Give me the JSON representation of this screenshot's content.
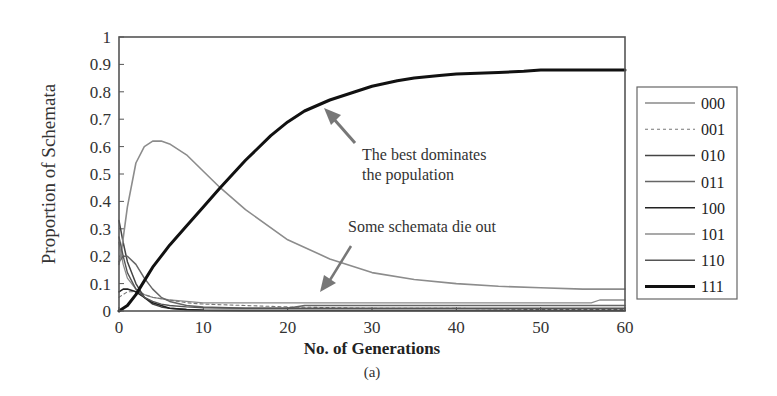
{
  "chart_data": {
    "type": "line",
    "title": "",
    "caption": "(a)",
    "xlabel": "No. of Generations",
    "ylabel": "Proportion of Schemata",
    "xlim": [
      0,
      60
    ],
    "ylim": [
      0,
      1
    ],
    "xticks": [
      0,
      10,
      20,
      30,
      40,
      50,
      60
    ],
    "xtick_labels": [
      "0",
      "10",
      "20",
      "30",
      "40",
      "50",
      "60"
    ],
    "yticks": [
      0,
      0.1,
      0.2,
      0.3,
      0.4,
      0.5,
      0.6,
      0.7,
      0.8,
      0.9,
      1
    ],
    "ytick_labels": [
      "0",
      "0.1",
      "0.2",
      "0.3",
      "0.4",
      "0.5",
      "0.6",
      "0.7",
      "0.8",
      "0.9",
      "1"
    ],
    "grid": false,
    "legend_position": "right",
    "series": [
      {
        "name": "000",
        "color": "#8a8a8a",
        "width": 1.3,
        "dash": "",
        "x": [
          0,
          0.5,
          1,
          2,
          3,
          4,
          6,
          8,
          10,
          15,
          20,
          30,
          40,
          50,
          56,
          57,
          60
        ],
        "y": [
          0.25,
          0.17,
          0.12,
          0.08,
          0.06,
          0.05,
          0.04,
          0.035,
          0.03,
          0.03,
          0.03,
          0.03,
          0.03,
          0.03,
          0.03,
          0.04,
          0.04
        ]
      },
      {
        "name": "001",
        "color": "#777777",
        "width": 1.1,
        "dash": "3,3",
        "x": [
          0,
          1,
          2,
          3,
          4,
          5,
          6,
          8,
          10,
          15,
          20,
          30,
          40,
          50,
          60
        ],
        "y": [
          0.05,
          0.07,
          0.07,
          0.06,
          0.05,
          0.045,
          0.04,
          0.03,
          0.025,
          0.02,
          0.015,
          0.01,
          0.01,
          0.005,
          0.005
        ]
      },
      {
        "name": "010",
        "color": "#444444",
        "width": 1.5,
        "dash": "",
        "x": [
          0,
          0.5,
          1,
          2,
          3,
          4,
          5,
          6,
          8,
          10,
          15,
          20,
          30,
          40,
          50,
          60
        ],
        "y": [
          0.33,
          0.25,
          0.18,
          0.1,
          0.05,
          0.025,
          0.015,
          0.01,
          0.005,
          0.003,
          0.002,
          0.002,
          0.002,
          0.002,
          0.002,
          0.002
        ]
      },
      {
        "name": "011",
        "color": "#666666",
        "width": 1.5,
        "dash": "",
        "x": [
          0,
          0.5,
          1,
          2,
          3,
          4,
          5,
          6,
          8,
          10,
          15,
          20,
          22,
          30,
          40,
          50,
          60
        ],
        "y": [
          0.18,
          0.2,
          0.2,
          0.17,
          0.12,
          0.08,
          0.05,
          0.035,
          0.02,
          0.015,
          0.01,
          0.01,
          0.02,
          0.02,
          0.02,
          0.02,
          0.02
        ]
      },
      {
        "name": "100",
        "color": "#222222",
        "width": 1.6,
        "dash": "",
        "x": [
          0,
          0.5,
          1,
          2,
          3,
          4,
          5,
          6,
          8,
          10,
          15,
          20,
          30,
          40,
          50,
          60
        ],
        "y": [
          0.07,
          0.08,
          0.08,
          0.07,
          0.05,
          0.03,
          0.02,
          0.01,
          0.005,
          0.003,
          0.002,
          0.002,
          0.002,
          0.002,
          0.002,
          0.002
        ]
      },
      {
        "name": "101",
        "color": "#8c8c8c",
        "width": 1.6,
        "dash": "",
        "x": [
          0,
          0.3,
          1,
          2,
          3,
          4,
          5,
          6,
          8,
          10,
          12,
          15,
          20,
          25,
          30,
          35,
          40,
          45,
          50,
          55,
          60
        ],
        "y": [
          0.17,
          0.22,
          0.38,
          0.54,
          0.6,
          0.62,
          0.62,
          0.61,
          0.57,
          0.51,
          0.45,
          0.37,
          0.26,
          0.19,
          0.14,
          0.115,
          0.1,
          0.09,
          0.085,
          0.08,
          0.08
        ]
      },
      {
        "name": "110",
        "color": "#555555",
        "width": 1.4,
        "dash": "",
        "x": [
          0,
          0.5,
          1,
          2,
          3,
          4,
          5,
          6,
          8,
          10,
          15,
          20,
          30,
          40,
          50,
          60
        ],
        "y": [
          0.27,
          0.2,
          0.14,
          0.08,
          0.05,
          0.035,
          0.025,
          0.02,
          0.015,
          0.012,
          0.01,
          0.01,
          0.01,
          0.01,
          0.01,
          0.01
        ]
      },
      {
        "name": "111",
        "color": "#111111",
        "width": 3,
        "dash": "",
        "x": [
          0,
          1,
          2,
          3,
          4,
          5,
          6,
          8,
          10,
          12,
          15,
          18,
          20,
          22,
          25,
          28,
          30,
          33,
          35,
          38,
          40,
          45,
          48,
          50,
          55,
          60
        ],
        "y": [
          0.0,
          0.02,
          0.06,
          0.11,
          0.16,
          0.2,
          0.24,
          0.31,
          0.38,
          0.45,
          0.55,
          0.64,
          0.69,
          0.73,
          0.77,
          0.8,
          0.82,
          0.84,
          0.85,
          0.86,
          0.865,
          0.87,
          0.875,
          0.88,
          0.88,
          0.88
        ]
      }
    ],
    "annotations": [
      {
        "text_lines": [
          "The best dominates",
          "the population"
        ],
        "arrow_from": [
          26.5,
          0.59
        ],
        "arrow_to": [
          24.3,
          0.73
        ]
      },
      {
        "text_lines": [
          "Some schemata die out"
        ],
        "arrow_from": [
          27.5,
          0.23
        ],
        "arrow_to": [
          23.8,
          0.07
        ]
      }
    ]
  },
  "axis": {
    "ylabel": "Proportion of Schemata",
    "xlabel": "No. of Generations",
    "caption": "(a)"
  },
  "annotations": {
    "best_line1": "The best dominates",
    "best_line2": "the population",
    "dieout": "Some schemata die out"
  },
  "legend": {
    "items": [
      {
        "label": "000"
      },
      {
        "label": "001"
      },
      {
        "label": "010"
      },
      {
        "label": "011"
      },
      {
        "label": "100"
      },
      {
        "label": "101"
      },
      {
        "label": "110"
      },
      {
        "label": "111"
      }
    ]
  }
}
